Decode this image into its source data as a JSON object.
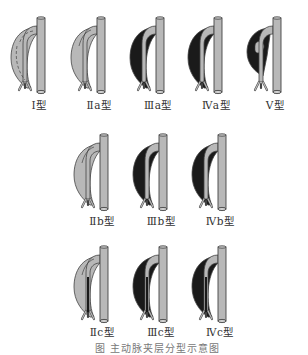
{
  "colors": {
    "vessel_fill": "#b8b8b8",
    "vessel_stroke": "#444444",
    "dark_fill": "#1a1a1a",
    "background": "#ffffff"
  },
  "rows": [
    {
      "figures": [
        {
          "id": "I",
          "label": "Ⅰ型",
          "type": "I",
          "cx": 41,
          "top": 16
        },
        {
          "id": "IIa",
          "label": "Ⅱa型",
          "type": "IIa",
          "cx": 101,
          "top": 16
        },
        {
          "id": "IIIa",
          "label": "Ⅲa型",
          "type": "IIIa",
          "cx": 160,
          "top": 16
        },
        {
          "id": "IVa",
          "label": "Ⅳa型",
          "type": "IVa",
          "cx": 218,
          "top": 16
        },
        {
          "id": "V",
          "label": "Ⅴ型",
          "type": "V",
          "cx": 277,
          "top": 16
        }
      ],
      "label_top": 97
    },
    {
      "figures": [
        {
          "id": "IIb",
          "label": "Ⅱb型",
          "type": "IIb",
          "cx": 104,
          "top": 133
        },
        {
          "id": "IIIb",
          "label": "Ⅲb型",
          "type": "IIIb",
          "cx": 163,
          "top": 133
        },
        {
          "id": "IVb",
          "label": "Ⅳb型",
          "type": "IVb",
          "cx": 222,
          "top": 133
        }
      ],
      "label_top": 213
    },
    {
      "figures": [
        {
          "id": "IIc",
          "label": "Ⅱc型",
          "type": "IIc",
          "cx": 104,
          "top": 245
        },
        {
          "id": "IIIc",
          "label": "Ⅲc型",
          "type": "IIIc",
          "cx": 163,
          "top": 245
        },
        {
          "id": "IVc",
          "label": "Ⅳc型",
          "type": "IVc",
          "cx": 222,
          "top": 245
        }
      ],
      "label_top": 324
    }
  ],
  "caption": "图  主动脉夹层分型示意图"
}
